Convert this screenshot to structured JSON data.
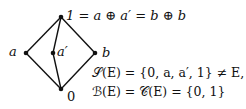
{
  "diagram": {
    "type": "hasse-diagram",
    "nodes": [
      {
        "id": "top",
        "label": "1 = a ⊕ a′ = b ⊕ b",
        "x": 61,
        "y": 17
      },
      {
        "id": "a",
        "label": "a",
        "x": 26,
        "y": 53
      },
      {
        "id": "a_prime",
        "label": "a′",
        "x": 53,
        "y": 53
      },
      {
        "id": "b",
        "label": "b",
        "x": 95,
        "y": 53
      },
      {
        "id": "bottom",
        "label": "0",
        "x": 61,
        "y": 89
      }
    ],
    "edges": [
      [
        "bottom",
        "a"
      ],
      [
        "bottom",
        "a_prime"
      ],
      [
        "bottom",
        "b"
      ],
      [
        "a",
        "top"
      ],
      [
        "a_prime",
        "top"
      ],
      [
        "b",
        "top"
      ]
    ],
    "equations": [
      "𝒮(E) = {0, a, a′, 1} ≠ E,",
      "ℬ(E) = 𝒞(E) = {0, 1}"
    ]
  }
}
